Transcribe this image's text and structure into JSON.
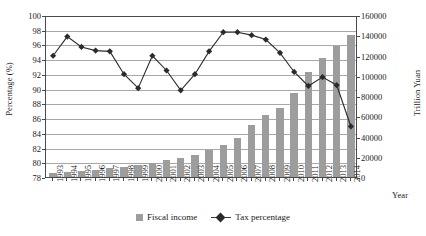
{
  "chart_data": {
    "type": "bar",
    "title": "",
    "xlabel": "Year",
    "ylabel": "Percentage (%)",
    "y2label": "Trillion Yuan",
    "categories": [
      "1993",
      "1994",
      "1995",
      "1996",
      "1997",
      "1998",
      "1999",
      "2000",
      "2001",
      "2002",
      "2003",
      "2004",
      "2005",
      "2006",
      "2007",
      "2008",
      "2009",
      "2010",
      "2011",
      "2012",
      "2013",
      "2014"
    ],
    "ylim": [
      78,
      100
    ],
    "y2lim": [
      0,
      160000
    ],
    "yticks": [
      78,
      80,
      82,
      84,
      86,
      88,
      90,
      92,
      94,
      96,
      98,
      100
    ],
    "y2ticks": [
      0,
      20000,
      40000,
      60000,
      80000,
      100000,
      120000,
      140000,
      160000
    ],
    "grid": true,
    "legend_position": "bottom",
    "series": [
      {
        "name": "Fiscal income",
        "type": "bar",
        "axis": "right",
        "unit": "Trillion Yuan",
        "color": "#9d9d9d",
        "values": [
          4349,
          5218,
          6242,
          7408,
          8651,
          9876,
          11444,
          13395,
          16386,
          18904,
          21715,
          26396,
          31649,
          38760,
          51322,
          61330,
          68518,
          83102,
          103874,
          117254,
          129210,
          140370
        ]
      },
      {
        "name": "Tax percentage",
        "type": "line",
        "axis": "left",
        "unit": "%",
        "color": "#2b2b2b",
        "marker": "diamond",
        "values": [
          94.6,
          97.2,
          95.8,
          95.3,
          95.2,
          92.1,
          90.2,
          94.6,
          92.6,
          89.9,
          92.1,
          95.2,
          97.8,
          97.8,
          97.4,
          96.8,
          95.0,
          92.4,
          90.5,
          91.7,
          90.6,
          85.0
        ]
      }
    ]
  },
  "legend": {
    "items": [
      {
        "label": "Fiscal income",
        "marker": "square"
      },
      {
        "label": "Tax percentage",
        "marker": "diamond-line"
      }
    ]
  },
  "axes": {
    "left_title": "Percentage (%)",
    "right_title": "Trillion Yuan",
    "x_title": "Year"
  }
}
